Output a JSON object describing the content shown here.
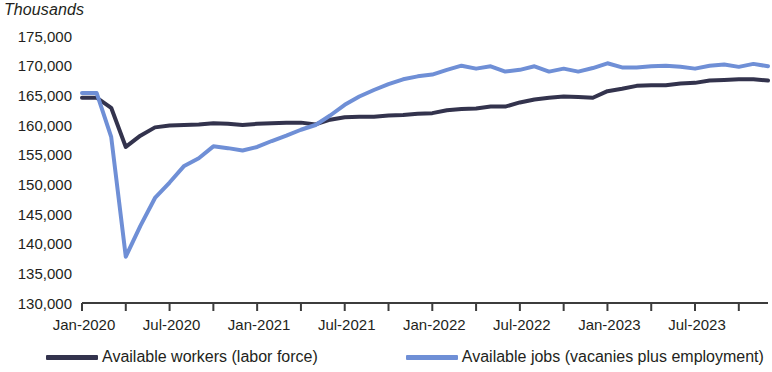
{
  "units_label": "Thousands",
  "legend": {
    "items": [
      {
        "label": "Available workers (labor force)",
        "color": "#33334d",
        "key": "workers"
      },
      {
        "label": "Available jobs (vacanies plus employment)",
        "color": "#6f8fd6",
        "key": "jobs"
      }
    ]
  },
  "chart_data": {
    "type": "line",
    "title": "",
    "subtitle": "",
    "xlabel": "",
    "ylabel": "Thousands",
    "ylim": [
      130000,
      175000
    ],
    "ytick_step": 5000,
    "ytick_labels": [
      "175,000",
      "170,000",
      "165,000",
      "160,000",
      "155,000",
      "150,000",
      "145,000",
      "140,000",
      "135,000",
      "130,000"
    ],
    "ytick_values": [
      175000,
      170000,
      165000,
      160000,
      155000,
      150000,
      145000,
      140000,
      135000,
      130000
    ],
    "xtick_labels": [
      "Jan-2020",
      "Jul-2020",
      "Jan-2021",
      "Jul-2021",
      "Jan-2022",
      "Jul-2022",
      "Jan-2023",
      "Jul-2023"
    ],
    "x_start": "2020-01",
    "x_end": "2023-12",
    "x_minor_tick_months": 3,
    "grid": false,
    "legend_position": "bottom",
    "x": [
      "Jan-2020",
      "Feb-2020",
      "Mar-2020",
      "Apr-2020",
      "May-2020",
      "Jun-2020",
      "Jul-2020",
      "Aug-2020",
      "Sep-2020",
      "Oct-2020",
      "Nov-2020",
      "Dec-2020",
      "Jan-2021",
      "Feb-2021",
      "Mar-2021",
      "Apr-2021",
      "May-2021",
      "Jun-2021",
      "Jul-2021",
      "Aug-2021",
      "Sep-2021",
      "Oct-2021",
      "Nov-2021",
      "Dec-2021",
      "Jan-2022",
      "Feb-2022",
      "Mar-2022",
      "Apr-2022",
      "May-2022",
      "Jun-2022",
      "Jul-2022",
      "Aug-2022",
      "Sep-2022",
      "Oct-2022",
      "Nov-2022",
      "Dec-2022",
      "Jan-2023",
      "Feb-2023",
      "Mar-2023",
      "Apr-2023",
      "May-2023",
      "Jun-2023",
      "Jul-2023",
      "Aug-2023",
      "Sep-2023",
      "Oct-2023",
      "Nov-2023",
      "Dec-2023"
    ],
    "series": [
      {
        "name": "Available workers (labor force)",
        "color": "#33334d",
        "values": [
          164600,
          164600,
          162900,
          156300,
          158200,
          159600,
          159900,
          160000,
          160100,
          160300,
          160200,
          160000,
          160200,
          160300,
          160400,
          160400,
          160100,
          160900,
          161300,
          161400,
          161400,
          161600,
          161700,
          161900,
          162000,
          162500,
          162700,
          162800,
          163100,
          163100,
          163800,
          164300,
          164600,
          164800,
          164700,
          164600,
          165700,
          166100,
          166600,
          166700,
          166700,
          167000,
          167100,
          167500,
          167600,
          167700,
          167700,
          167500
        ],
        "style": "solid",
        "width": 4
      },
      {
        "name": "Available jobs (vacanies plus employment)",
        "color": "#6f8fd6",
        "values": [
          165400,
          165400,
          158000,
          137800,
          143000,
          147700,
          150300,
          153100,
          154400,
          156400,
          156100,
          155700,
          156300,
          157300,
          158200,
          159200,
          160000,
          161600,
          163400,
          164800,
          165900,
          166900,
          167700,
          168200,
          168500,
          169300,
          170000,
          169500,
          169900,
          169000,
          169300,
          169900,
          169000,
          169500,
          169000,
          169600,
          170400,
          169700,
          169700,
          169900,
          170000,
          169800,
          169500,
          170000,
          170200,
          169800,
          170300,
          169900
        ],
        "style": "solid",
        "width": 4
      }
    ]
  }
}
